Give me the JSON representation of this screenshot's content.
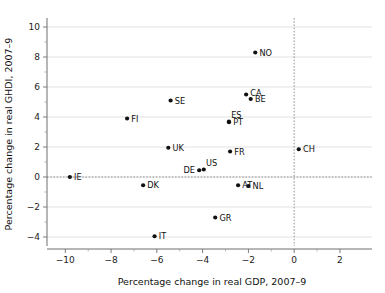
{
  "chart_data": {
    "type": "scatter",
    "title": "",
    "xlabel": "Percentage change in real GDP, 2007–9",
    "ylabel": "Percentage change in real GHDI, 2007–9",
    "xlim": [
      -10.8,
      3.4
    ],
    "ylim": [
      -4.6,
      10.6
    ],
    "xticks": [
      -10,
      -8,
      -6,
      -4,
      -2,
      0,
      2
    ],
    "xtick_labels": [
      "−10",
      "−8",
      "−6",
      "−4",
      "−2",
      "0",
      "2"
    ],
    "yticks": [
      -4,
      -2,
      0,
      2,
      4,
      6,
      8,
      10
    ],
    "ytick_labels": [
      "−4",
      "−2",
      "0",
      "2",
      "4",
      "6",
      "8",
      "10"
    ],
    "grid": "horizontal",
    "legend": "none",
    "reference_lines": [
      {
        "axis": "y",
        "value": 0,
        "style": "dotted"
      },
      {
        "axis": "x",
        "value": 0,
        "style": "dotted"
      }
    ],
    "points": [
      {
        "label": "NO",
        "x": -1.7,
        "y": 8.3,
        "label_pos": "right"
      },
      {
        "label": "CA",
        "x": -2.1,
        "y": 5.5,
        "label_pos": "right-up"
      },
      {
        "label": "BE",
        "x": -1.9,
        "y": 5.2,
        "label_pos": "right"
      },
      {
        "label": "SE",
        "x": -5.4,
        "y": 5.1,
        "label_pos": "right"
      },
      {
        "label": "FI",
        "x": -7.3,
        "y": 3.9,
        "label_pos": "right"
      },
      {
        "label": "ES",
        "x": -2.85,
        "y": 3.7,
        "label_pos": "above-right"
      },
      {
        "label": "PT",
        "x": -2.85,
        "y": 3.65,
        "label_pos": "right"
      },
      {
        "label": "UK",
        "x": -5.5,
        "y": 1.95,
        "label_pos": "right"
      },
      {
        "label": "FR",
        "x": -2.8,
        "y": 1.7,
        "label_pos": "right"
      },
      {
        "label": "CH",
        "x": 0.2,
        "y": 1.85,
        "label_pos": "right"
      },
      {
        "label": "US",
        "x": -3.95,
        "y": 0.5,
        "label_pos": "above-right"
      },
      {
        "label": "DE",
        "x": -4.15,
        "y": 0.45,
        "label_pos": "left"
      },
      {
        "label": "IE",
        "x": -9.8,
        "y": 0.0,
        "label_pos": "right"
      },
      {
        "label": "DK",
        "x": -6.6,
        "y": -0.55,
        "label_pos": "right"
      },
      {
        "label": "AT",
        "x": -2.45,
        "y": -0.55,
        "label_pos": "right"
      },
      {
        "label": "NL",
        "x": -2.0,
        "y": -0.6,
        "label_pos": "right"
      },
      {
        "label": "GR",
        "x": -3.45,
        "y": -2.7,
        "label_pos": "right"
      },
      {
        "label": "IT",
        "x": -6.1,
        "y": -3.95,
        "label_pos": "right"
      }
    ]
  },
  "colors": {
    "point": "#111111",
    "grid": "#d9d9d9",
    "axis": "#6f6f6f",
    "reference": "#8a8a8a",
    "background": "#ffffff"
  }
}
